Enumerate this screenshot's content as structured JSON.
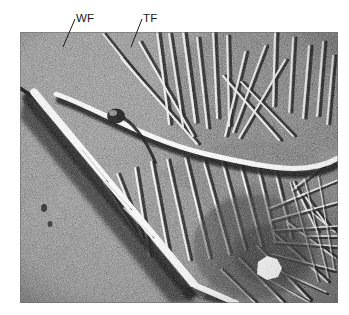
{
  "figure": {
    "kind": "electron-micrograph",
    "background_color": "#ffffff",
    "plate": {
      "x": 20,
      "y": 32,
      "width": 318,
      "height": 271,
      "base_gray": "#8a8a8a",
      "highlight_color": "#ffffff",
      "shadow_color": "#0a0a0a"
    }
  },
  "annotations": [
    {
      "id": "wf",
      "label": "WF",
      "meaning": "wide fibril",
      "label_x": 76,
      "label_y": 13,
      "leader": {
        "x1": 75,
        "y1": 19,
        "x2": 63,
        "y2": 47
      }
    },
    {
      "id": "tf",
      "label": "TF",
      "meaning": "thin fibril",
      "label_x": 143,
      "label_y": 13,
      "leader": {
        "x1": 142,
        "y1": 19,
        "x2": 131,
        "y2": 47
      }
    }
  ],
  "colors": {
    "text": "#1a1a1a",
    "leader_line": "#1a1a1a",
    "page_background": "#ffffff"
  }
}
